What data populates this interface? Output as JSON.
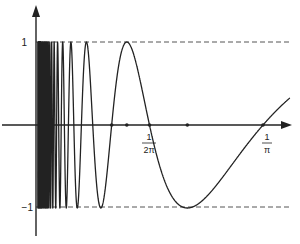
{
  "figure": {
    "function": "sin(1/x)",
    "colors": {
      "ink": "#222222",
      "background": "#ffffff"
    },
    "y_labels": {
      "top": "1",
      "bottom": "−1"
    },
    "x_labels": [
      {
        "num": "1",
        "den": "2π",
        "x_value": 0.159155
      },
      {
        "num": "1",
        "den": "π",
        "x_value": 0.31831
      }
    ],
    "marked_points_x": [
      0.106103,
      0.127324,
      0.159155,
      0.212207,
      0.31831
    ],
    "guides": [
      {
        "name": "y=1",
        "y": 1,
        "style": "dashed"
      },
      {
        "name": "y=-1",
        "y": -1,
        "style": "dashed"
      }
    ]
  },
  "chart_data": {
    "type": "line",
    "title": "",
    "xlabel": "",
    "ylabel": "",
    "series": [
      {
        "name": "sin(1/x)",
        "formula": "y = sin(1/x)",
        "x_range": [
          0.0,
          0.356
        ]
      }
    ],
    "x_tick_labels": [
      "1/(2π)",
      "1/π"
    ],
    "y_tick_labels": [
      "1",
      "-1"
    ],
    "ylim": [
      -1,
      1
    ],
    "grid": false,
    "legend": "none"
  }
}
